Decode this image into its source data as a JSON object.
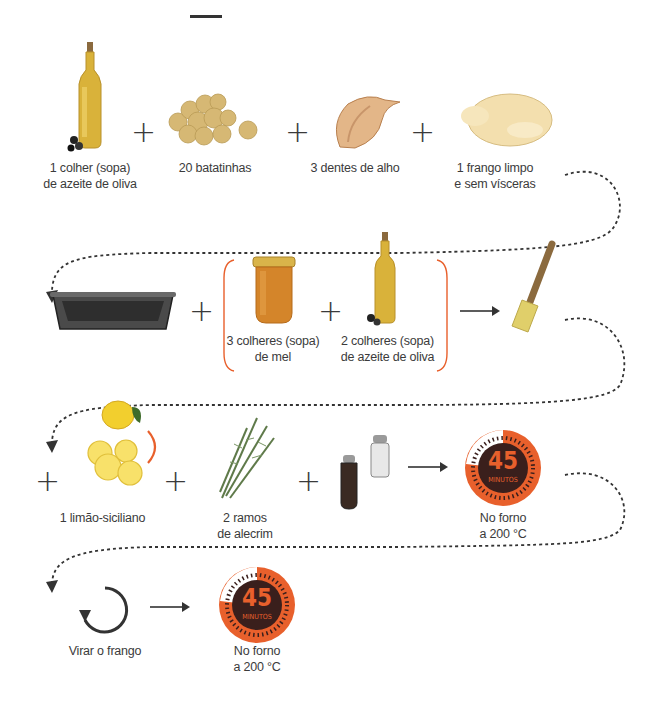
{
  "header": {
    "bar": "—"
  },
  "steps": {
    "row1": {
      "items": [
        {
          "icon": "olive-oil-bottle-icon",
          "label_l1": "1 colher (sopa)",
          "label_l2": "de azeite de oliva"
        },
        {
          "icon": "potatoes-icon",
          "label_l1": "20 batatinhas",
          "label_l2": ""
        },
        {
          "icon": "garlic-icon",
          "label_l1": "3 dentes de alho",
          "label_l2": ""
        },
        {
          "icon": "chicken-icon",
          "label_l1": "1 frango limpo",
          "label_l2": "e sem vísceras"
        }
      ],
      "operator": "+"
    },
    "row2": {
      "items": [
        {
          "icon": "roasting-pan-icon",
          "label_l1": "",
          "label_l2": ""
        },
        {
          "icon": "honey-jar-icon",
          "label_l1": "3 colheres (sopa)",
          "label_l2": "de mel"
        },
        {
          "icon": "olive-oil-bottle-icon",
          "label_l1": "2 colheres (sopa)",
          "label_l2": "de azeite de oliva"
        },
        {
          "icon": "pastry-brush-icon",
          "label_l1": "",
          "label_l2": ""
        }
      ],
      "operator": "+",
      "arrow": "→"
    },
    "row3": {
      "items": [
        {
          "icon": "lemon-icon",
          "label_l1": "1 limão-siciliano",
          "label_l2": ""
        },
        {
          "icon": "rosemary-icon",
          "label_l1": "2 ramos",
          "label_l2": "de alecrim"
        },
        {
          "icon": "salt-pepper-mill-icon",
          "label_l1": "",
          "label_l2": ""
        },
        {
          "icon": "timer-icon",
          "timer_value": "45",
          "timer_unit": "MINUTOS",
          "label_l1": "No forno",
          "label_l2": "a 200 °C"
        }
      ],
      "operator": "+",
      "arrow": "→"
    },
    "row4": {
      "items": [
        {
          "icon": "rotate-icon",
          "label_l1": "Virar o frango",
          "label_l2": ""
        },
        {
          "icon": "timer-icon",
          "timer_value": "45",
          "timer_unit": "MINUTOS",
          "label_l1": "No forno",
          "label_l2": "a 200 °C"
        }
      ],
      "arrow": "→"
    }
  },
  "colors": {
    "accent": "#e8602c",
    "timer_dark": "#3a1f1c",
    "text": "#3b3b3b",
    "oil": "#d9b23a",
    "lemon": "#f5d847"
  }
}
